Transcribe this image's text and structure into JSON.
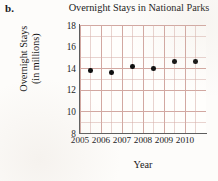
{
  "problem_label": "b.",
  "chart_data": {
    "type": "scatter",
    "title": "Overnight Stays in National Parks",
    "xlabel": "Year",
    "ylabel_line1": "Overnight Stays",
    "ylabel_line2": "(in millions)",
    "categories": [
      "2005",
      "2006",
      "2007",
      "2008",
      "2009",
      "2010"
    ],
    "x": [
      2005,
      2006,
      2007,
      2008,
      2009,
      2010
    ],
    "values": [
      13.8,
      13.6,
      14.15,
      13.95,
      14.6,
      14.6
    ],
    "xtick_labels": [
      "2005",
      "2006",
      "2007",
      "2008",
      "2009",
      "2010"
    ],
    "ytick_labels": [
      "18",
      "16",
      "14",
      "12",
      "10",
      "8"
    ],
    "yticks": [
      18,
      16,
      14,
      12,
      10,
      8
    ],
    "ylim": [
      8,
      18
    ],
    "xlim": [
      2004.5,
      2010.5
    ],
    "grid": true,
    "grid_color": "#c48c84",
    "minor_grid": true,
    "point_color": "#101010",
    "legend": "none",
    "series": [
      {
        "name": "Overnight Stays",
        "points": [
          {
            "year": "2005",
            "value": 13.8
          },
          {
            "year": "2006",
            "value": 13.6
          },
          {
            "year": "2007",
            "value": 14.15
          },
          {
            "year": "2008",
            "value": 13.95
          },
          {
            "year": "2009",
            "value": 14.6
          },
          {
            "year": "2010",
            "value": 14.6
          }
        ]
      }
    ]
  }
}
